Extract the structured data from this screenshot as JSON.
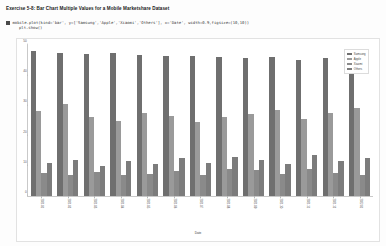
{
  "heading": {
    "title": "Exercise 5-8: Bar Chart Multiple Values for a Mobile Marketshare Dataset"
  },
  "code_cell": {
    "marker": "",
    "line1": "mobile.plot(kind='bar', y=['Samsung','Apple','Xiaomi','Others'], x='Date', width=0.9,figsize=(10,10))",
    "line2": "plt.show()"
  },
  "figure": {
    "legend_title": "",
    "legend": [
      {
        "label": "Samsung",
        "color": "#6f6f6f"
      },
      {
        "label": "Apple",
        "color": "#9a9a9a"
      },
      {
        "label": "Xiaomi",
        "color": "#8a8a8a"
      },
      {
        "label": "Others",
        "color": "#7c7c7c"
      }
    ]
  },
  "chart_data": {
    "type": "bar",
    "title": "",
    "xlabel": "Date",
    "ylabel": "",
    "ylim": [
      0,
      50
    ],
    "yticks": [
      0,
      10,
      20,
      30,
      40,
      50
    ],
    "grid": false,
    "legend_position": "upper right",
    "categories": [
      "2021-01",
      "2021-02",
      "2021-03",
      "2021-04",
      "2021-05",
      "2021-06",
      "2021-07",
      "2021-08",
      "2021-09",
      "2021-10",
      "2021-11",
      "2021-12",
      "2022-01"
    ],
    "series": [
      {
        "name": "Samsung",
        "color": "#6f6f6f",
        "values": [
          48.0,
          47.5,
          47.0,
          47.4,
          46.8,
          46.2,
          46.5,
          46.0,
          45.6,
          46.0,
          45.2,
          45.8,
          45.0
        ]
      },
      {
        "name": "Apple",
        "color": "#9a9a9a",
        "values": [
          28.0,
          30.5,
          26.0,
          25.0,
          27.5,
          26.5,
          24.5,
          26.0,
          27.0,
          28.5,
          25.5,
          27.5,
          29.0
        ]
      },
      {
        "name": "Xiaomi",
        "color": "#8a8a8a",
        "values": [
          7.5,
          7.0,
          7.8,
          6.8,
          7.4,
          8.2,
          7.0,
          9.0,
          8.6,
          7.2,
          8.8,
          7.6,
          7.0
        ]
      },
      {
        "name": "Others",
        "color": "#7c7c7c",
        "values": [
          11.0,
          12.0,
          10.0,
          11.5,
          10.5,
          12.5,
          11.0,
          13.0,
          12.0,
          10.5,
          13.5,
          11.5,
          12.5
        ]
      }
    ]
  }
}
